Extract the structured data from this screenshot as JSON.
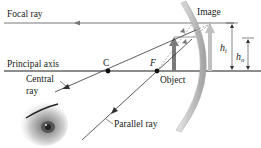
{
  "diagram": {
    "type": "convex-mirror-ray-diagram",
    "labels": {
      "focal_ray": "Focal ray",
      "principal_axis": "Principal axis",
      "center_point": "C",
      "focal_point": "F",
      "object": "Object",
      "image": "Image",
      "central_ray_line1": "Central",
      "central_ray_line2": "ray",
      "parallel_ray": "Parallel ray",
      "image_height": "h",
      "image_height_sub": "i",
      "object_height": "h",
      "object_height_sub": "o"
    },
    "colors": {
      "line": "#1a1a1a",
      "mirror": "#c8c8c8",
      "mirror_edge": "#a0a0a0",
      "object_arrow": "#7a7a7a",
      "image_arrow": "#bdbdbd",
      "dashed": "#8a8a8a"
    }
  }
}
